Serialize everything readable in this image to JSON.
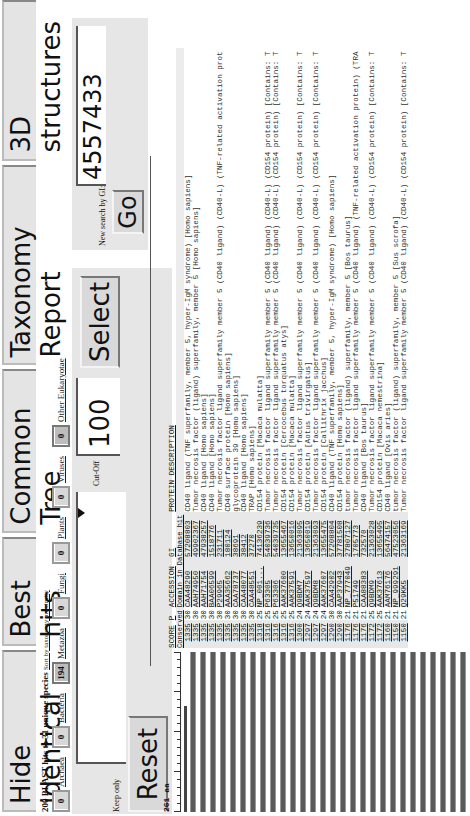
{
  "tabs": [
    {
      "label": "Hide identical"
    },
    {
      "label": "Best hits"
    },
    {
      "label": "Common Tree"
    },
    {
      "label": "Taxonomy Report"
    },
    {
      "label": "3D structures"
    }
  ],
  "summary": {
    "text": "200 BLAST hits to 31 unique species",
    "sort_link": "Sort by taxonomy proximity"
  },
  "taxonomy_filters": [
    {
      "count": "0",
      "label": "Archaea"
    },
    {
      "count": "0",
      "label": "Bacteria"
    },
    {
      "count": "194",
      "label": "Metazoa",
      "active": true
    },
    {
      "count": "0",
      "label": "Fungi"
    },
    {
      "count": "0",
      "label": "Plants"
    },
    {
      "count": "0",
      "label": "Viruses"
    },
    {
      "count": "0",
      "label": "Other Eukaryotae"
    }
  ],
  "filter": {
    "keep_only_label": "Keep only",
    "keep_only_value": "",
    "cutoff_label": "Cut-Off",
    "cutoff_value": "100",
    "select_label": "Select",
    "reset_label": "Reset"
  },
  "gi_search": {
    "label": "New search by GI:",
    "value": "4557433",
    "go_label": "Go"
  },
  "ruler": {
    "label": "261 aa"
  },
  "table": {
    "headers": {
      "score": "SCORE",
      "p": "P",
      "accession": "ACCESSION",
      "gi": "GI",
      "description": "PROTEIN DESCRIPTION"
    },
    "subheaders": {
      "conserved": "Conserved",
      "domain": "Domain in Database hit"
    },
    "rows": [
      {
        "score": "1335",
        "p": "30",
        "accession": "CAA48290",
        "gi": "57208803",
        "description": "CD40 ligand (TNF superfamily, member 5, hyper-IgM syndrome) [Homo sapiens]"
      },
      {
        "score": "1335",
        "p": "30",
        "accession": "AAH74950",
        "gi": "49902367",
        "description": "Tumor necrosis factor (ligand) superfamily, member 5 [Homo sapiens]"
      },
      {
        "score": "1335",
        "p": "30",
        "accession": "AAH71754",
        "gi": "47938257",
        "description": "CD40 ligand [Homo sapiens]"
      },
      {
        "score": "1335",
        "p": "30",
        "accession": "BAA06599",
        "gi": "1518776",
        "description": "CD40 ligand [Homo sapiens]"
      },
      {
        "score": "1335",
        "p": "30",
        "accession": "P29965",
        "gi": "231711",
        "description": "Tumor necrosis factor ligand superfamily member 5 (CD40 ligand) (CD40-L) (TNF-related activation prot"
      },
      {
        "score": "1335",
        "p": "30",
        "accession": "AAA35662",
        "gi": "180124",
        "description": "CD40 surface protein [Homo sapiens]"
      },
      {
        "score": "1335",
        "p": "30",
        "accession": "CAA78737",
        "gi": "38691",
        "description": "glycoprotein 39 [Homo sapiens]"
      },
      {
        "score": "1335",
        "p": "30",
        "accession": "CAA48077",
        "gi": "38412",
        "description": "CD40 ligand [Homo sapiens]"
      },
      {
        "score": "1335",
        "p": "30",
        "accession": "CAA48551",
        "gi": "37270",
        "description": "TRAP [Homo sapiens]"
      },
      {
        "score": "1318",
        "p": "25",
        "accession": "NP_001...",
        "gi": "74136239",
        "description": "CD154 protein [Macaca mulatta]"
      },
      {
        "score": "1316",
        "p": "25",
        "accession": "P63305",
        "gi": "54039736",
        "description": "Tumor necrosis factor ligand superfamily member 5 (CD40 ligand) (CD40-L) (CD154 protein) [Contains: T"
      },
      {
        "score": "1316",
        "p": "25",
        "accession": "P63306",
        "gi": "54039735",
        "description": "Tumor necrosis factor ligand superfamily member 5 (CD40 ligand) (CD40-L) (CD154 protein) [Contains: T"
      },
      {
        "score": "1316",
        "p": "25",
        "accession": "AAK37600",
        "gi": "13655467",
        "description": "CD154 protein [Cercocebus torquatus atys]"
      },
      {
        "score": "1316",
        "p": "25",
        "accession": "AAK37591",
        "gi": "13650016",
        "description": "CD154 protein [Macaca mulatta]"
      },
      {
        "score": "1300",
        "p": "24",
        "accession": "Q9BDM7",
        "gi": "21363095",
        "description": "Tumor necrosis factor ligand superfamily member 5 (CD40 ligand) (CD40-L) (CD154 protein) [Contains: T"
      },
      {
        "score": "1297",
        "p": "24",
        "accession": "AAK37597",
        "gi": "13650019",
        "description": "CD154 protein [Aotus trivirgatus]"
      },
      {
        "score": "1297",
        "p": "24",
        "accession": "Q9BDM8",
        "gi": "21363093",
        "description": "Tumor necrosis factor ligand superfamily member 5 (CD40 ligand) (CD40-L) (CD154 protein) [Contains: T"
      },
      {
        "score": "1297",
        "p": "24",
        "accession": "AAK37607",
        "gi": "13655475",
        "description": "CD154 protein [Callithrix jacchus]"
      },
      {
        "score": "1290",
        "p": "30",
        "accession": "CAA42902",
        "gi": "57208804",
        "description": "CD40 ligand (TNF superfamily, member 5, hyper-IgM syndrome) [Homo sapiens]"
      },
      {
        "score": "1290",
        "p": "30",
        "accession": "AAP37943",
        "gi": "37781508",
        "description": "CD154 protein [Homo sapiens]"
      },
      {
        "score": "1176",
        "p": "21",
        "accession": "NP_777049",
        "gi": "27807127",
        "description": "tumor necrosis factor (ligand) superfamily, member 5 [Bos taurus]"
      },
      {
        "score": "1176",
        "p": "21",
        "accession": "P51749",
        "gi": "1705773",
        "description": "Tumor necrosis factor ligand superfamily member 5 (CD40 ligand) (TNF-related activation protein) (TRA"
      },
      {
        "score": "1176",
        "p": "21",
        "accession": "CAA88383",
        "gi": "732570",
        "description": "CD40 ligand [Bos taurus]"
      },
      {
        "score": "1172",
        "p": "25",
        "accession": "Q9BDM9",
        "gi": "21363028",
        "description": "Tumor necrosis factor ligand superfamily member 5 (CD40 ligand) (CD40-L) (CD154 protein) [Contains: T"
      },
      {
        "score": "1172",
        "p": "25",
        "accession": "AAK37613",
        "gi": "13655495",
        "description": "CD154 protein [Macaca nemestrina]"
      },
      {
        "score": "1160",
        "p": "21",
        "accession": "AAM76176",
        "gi": "56474157",
        "description": "CD40 ligand [Ovis aries]"
      },
      {
        "score": "1150",
        "p": "21",
        "accession": "NP_999291",
        "gi": "47523056",
        "description": "tumor necrosis factor (ligand) superfamily, member 5 [Sus scrofa]"
      },
      {
        "score": "1150",
        "p": "21",
        "accession": "Q29KK5",
        "gi": "21363169",
        "description": "Tumor necrosis factor ligand superfamily member 5 (CD40 ligand) (CD40-L) (CD154 protein) [Contains: T"
      }
    ]
  }
}
